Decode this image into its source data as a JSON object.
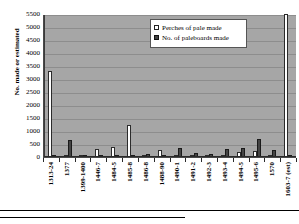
{
  "chart_data": {
    "type": "bar",
    "title": "",
    "xlabel": "",
    "ylabel": "No. made or estimated",
    "ylim": [
      0,
      5500
    ],
    "ytick_step": 500,
    "yticks": [
      "5500",
      "5000",
      "4500",
      "4000",
      "3500",
      "3000",
      "2500",
      "2000",
      "1500",
      "1000",
      "500",
      "0"
    ],
    "grid": true,
    "legend_position": "top-center-right",
    "categories": [
      "1313-24",
      "1377",
      "1399-1400",
      "1446-7",
      "1484-5",
      "1485-8",
      "1486-8",
      "1488-90",
      "1490-1",
      "1491-2",
      "1492-3",
      "1493-4",
      "1494-5",
      "1495-6",
      "1570",
      "1603-7 (est)"
    ],
    "series": [
      {
        "name": "Perches of pale made",
        "color": "#ffffff",
        "values": [
          3300,
          0,
          0,
          300,
          380,
          1250,
          0,
          260,
          0,
          0,
          0,
          0,
          180,
          250,
          0,
          5500
        ]
      },
      {
        "name": "No. of paleboards made",
        "color": "#444444",
        "values": [
          60,
          640,
          55,
          0,
          0,
          90,
          100,
          0,
          330,
          140,
          110,
          300,
          330,
          690,
          260,
          0
        ]
      }
    ]
  },
  "legend": {
    "items": [
      {
        "label": "Perches of pale made",
        "swatch": "pale"
      },
      {
        "label": "No. of paleboards made",
        "swatch": "boards"
      }
    ]
  },
  "axis": {
    "y_title": "No. made or estimated"
  }
}
